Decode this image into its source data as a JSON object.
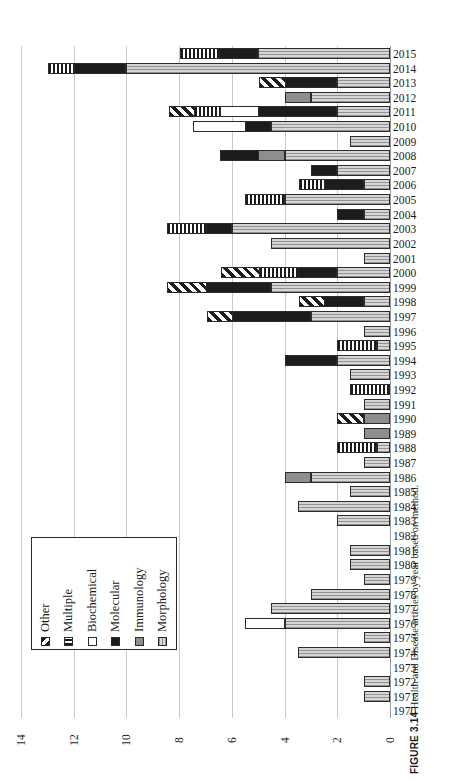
{
  "caption": {
    "number": "FIGURE 3.14",
    "text": "Health and Disease articles by year based on method."
  },
  "legend": {
    "items": [
      {
        "label": "Other",
        "pattern": "diagonal-hatch",
        "class": "p-other"
      },
      {
        "label": "Multiple",
        "pattern": "vertical-stripes",
        "class": "p-multiple"
      },
      {
        "label": "Biochemical",
        "pattern": "white",
        "class": "p-biochemical"
      },
      {
        "label": "Molecular",
        "pattern": "solid-black",
        "class": "p-molecular"
      },
      {
        "label": "Immunology",
        "pattern": "dark-gray",
        "class": "p-immunology"
      },
      {
        "label": "Morphology",
        "pattern": "light-gray-dots",
        "class": "p-morphology"
      }
    ]
  },
  "chart_data": {
    "type": "bar",
    "orientation": "horizontal-reversed",
    "title": "Health and Disease articles by year based on method.",
    "xlabel": "",
    "ylabel": "",
    "xlim": [
      0,
      14
    ],
    "xticks": [
      14,
      12,
      10,
      8,
      6,
      4,
      2,
      0
    ],
    "xtick_labels": [
      "14",
      "12",
      "10",
      "8",
      "6",
      "4",
      "2",
      "0"
    ],
    "grid": true,
    "legend_position": "left-middle",
    "stacked": true,
    "series_order": [
      "Morphology",
      "Immunology",
      "Molecular",
      "Biochemical",
      "Multiple",
      "Other"
    ],
    "categories": [
      "2015",
      "2014",
      "2013",
      "2012",
      "2011",
      "2010",
      "2009",
      "2008",
      "2007",
      "2006",
      "2005",
      "2004",
      "2003",
      "2002",
      "2001",
      "2000",
      "1999",
      "1998",
      "1997",
      "1996",
      "1995",
      "1994",
      "1993",
      "1992",
      "1991",
      "1990",
      "1989",
      "1988",
      "1987",
      "1986",
      "1985",
      "1984",
      "1983",
      "1982",
      "1981",
      "1980",
      "1979",
      "1978",
      "1977",
      "1976",
      "1975",
      "1974",
      "1973",
      "1972",
      "1971",
      "1970"
    ],
    "series": [
      {
        "name": "Morphology",
        "values": [
          5,
          10,
          2,
          3,
          2,
          4.5,
          1.5,
          4,
          2,
          1,
          4,
          1,
          6,
          4.5,
          1,
          2,
          4.5,
          1,
          3,
          1,
          0.5,
          2,
          1.5,
          0,
          1,
          0,
          0,
          0.5,
          1,
          3,
          1.5,
          3.5,
          2,
          0,
          1.5,
          1.5,
          1,
          3,
          4.5,
          4,
          1,
          3.5,
          0,
          1,
          1,
          0
        ]
      },
      {
        "name": "Immunology",
        "values": [
          0,
          0,
          0,
          1,
          0,
          0,
          0,
          1,
          0,
          0,
          0,
          0,
          0,
          0,
          0,
          0,
          0,
          0,
          0,
          0,
          0,
          0,
          0,
          0,
          0,
          1,
          1,
          0,
          0,
          1,
          0,
          0,
          0,
          0,
          0,
          0,
          0,
          0,
          0,
          0,
          0,
          0,
          0,
          0,
          0,
          0
        ]
      },
      {
        "name": "Molecular",
        "values": [
          1.5,
          2,
          2,
          0,
          3,
          1,
          0,
          1.5,
          1,
          1.5,
          0,
          1,
          1,
          0,
          0,
          1.5,
          2.5,
          1.5,
          3,
          0,
          0,
          2,
          0,
          0,
          0,
          0,
          0,
          0,
          0,
          0,
          0,
          0,
          0,
          0,
          0,
          0,
          0,
          0,
          0,
          0,
          0,
          0,
          0,
          0,
          0,
          0
        ]
      },
      {
        "name": "Biochemical",
        "values": [
          0,
          0,
          0,
          0,
          1.5,
          2,
          0,
          0,
          0,
          0,
          0,
          0,
          0,
          0,
          0,
          0,
          0,
          0,
          0,
          0,
          0,
          0,
          0,
          0,
          0,
          0,
          0,
          0,
          0,
          0,
          0,
          0,
          0,
          0,
          0,
          0,
          0,
          0,
          0,
          1.5,
          0,
          0,
          0,
          0,
          0,
          0
        ]
      },
      {
        "name": "Multiple",
        "values": [
          1.5,
          1,
          0,
          0,
          1,
          0,
          0,
          0,
          0,
          1,
          1.5,
          0,
          1.5,
          0,
          0,
          1.5,
          0,
          0,
          0,
          0,
          1.5,
          0,
          0,
          1.5,
          0,
          0,
          0,
          1.5,
          0,
          0,
          0,
          0,
          0,
          0,
          0,
          0,
          0,
          0,
          0,
          0,
          0,
          0,
          0,
          0,
          0,
          0
        ]
      },
      {
        "name": "Other",
        "values": [
          0,
          0,
          1,
          0,
          1,
          0,
          0,
          0,
          0,
          0,
          0,
          0,
          0,
          0,
          0,
          1.5,
          1.5,
          1,
          1,
          0,
          0,
          0,
          0,
          0,
          0,
          1,
          0,
          0,
          0,
          0,
          0,
          0,
          0,
          0,
          0,
          0,
          0,
          0,
          0,
          0,
          0,
          0,
          0,
          0,
          0,
          0
        ]
      }
    ]
  }
}
